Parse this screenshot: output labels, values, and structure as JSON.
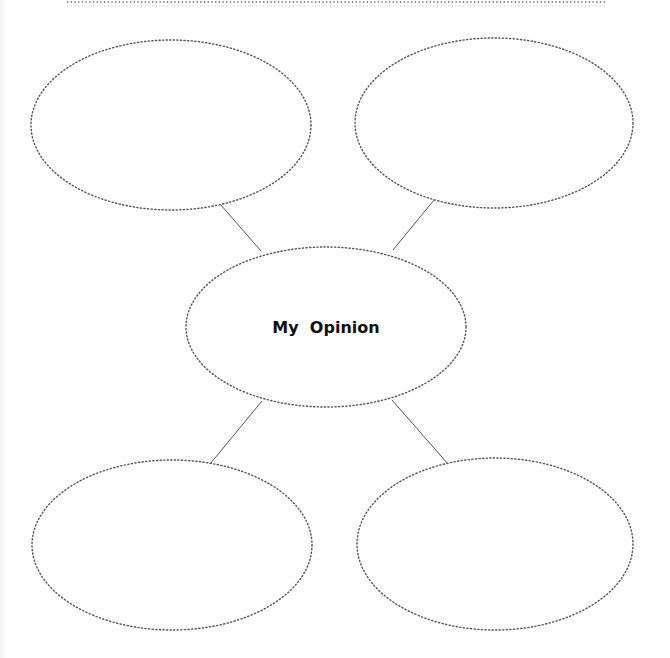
{
  "diagram": {
    "type": "bubble-map",
    "center": {
      "label": "My  Opinion"
    },
    "outer_bubbles": [
      {
        "position": "top-left",
        "label": ""
      },
      {
        "position": "top-right",
        "label": ""
      },
      {
        "position": "bottom-left",
        "label": ""
      },
      {
        "position": "bottom-right",
        "label": ""
      }
    ],
    "colors": {
      "outline": "#555555",
      "connector": "#555555",
      "text": "#111111",
      "background": "#ffffff"
    }
  }
}
